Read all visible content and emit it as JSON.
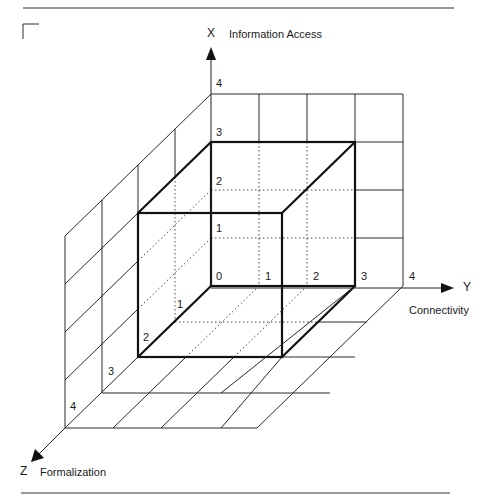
{
  "axes": {
    "x": {
      "letter": "X",
      "name": "Information Access"
    },
    "y": {
      "letter": "Y",
      "name": "Connectivity"
    },
    "z": {
      "letter": "Z",
      "name": "Formalization"
    }
  },
  "ticks": {
    "x": [
      "0",
      "1",
      "2",
      "3",
      "4"
    ],
    "y": [
      "1",
      "2",
      "3",
      "4"
    ],
    "z": [
      "1",
      "2",
      "3",
      "4"
    ]
  },
  "highlighted_box": {
    "x_max": 3,
    "y_max": 3,
    "z_max": 2
  },
  "grid_extent": {
    "x": 4,
    "y": 4,
    "z": 4
  },
  "colors": {
    "ink": "#1a1a1a",
    "background": "#ffffff"
  }
}
